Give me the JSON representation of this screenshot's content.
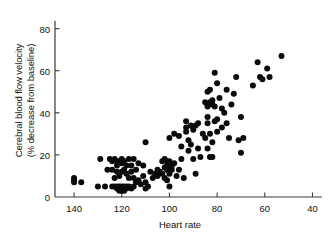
{
  "chart_data": {
    "type": "scatter",
    "title": "",
    "xlabel": "Heart rate",
    "ylabel": "Cerebral blood flow velocity (% decrease from baseline)",
    "ylabel_line1": "Cerebral blood flow velocity",
    "ylabel_line2": "(% decrease from baseline)",
    "xlim": [
      148,
      36
    ],
    "ylim": [
      0,
      86
    ],
    "x_reversed": true,
    "grid": false,
    "legend": null,
    "xticks": [
      140,
      120,
      100,
      80,
      60,
      40
    ],
    "xtick_labels": [
      "140",
      "120",
      "100",
      "80",
      "60",
      "40"
    ],
    "yticks": [
      0,
      20,
      40,
      60,
      80
    ],
    "ytick_labels": [
      "0",
      "20",
      "40",
      "60",
      "80"
    ],
    "marker": "filled-circle",
    "marker_color": "#0b0b0b",
    "marker_size_px": 3.0,
    "n_points": 147,
    "points": [
      [
        140,
        9
      ],
      [
        140,
        8
      ],
      [
        140,
        7
      ],
      [
        137,
        7
      ],
      [
        130,
        5
      ],
      [
        129,
        18
      ],
      [
        127,
        5
      ],
      [
        126,
        13
      ],
      [
        125,
        18
      ],
      [
        124,
        5
      ],
      [
        124,
        13
      ],
      [
        124,
        17
      ],
      [
        123,
        18
      ],
      [
        123,
        9
      ],
      [
        123,
        5
      ],
      [
        122,
        17
      ],
      [
        122,
        15
      ],
      [
        122,
        12
      ],
      [
        122,
        5
      ],
      [
        122,
        4
      ],
      [
        121,
        17
      ],
      [
        121,
        16
      ],
      [
        121,
        10
      ],
      [
        121,
        5
      ],
      [
        121,
        4
      ],
      [
        121,
        3
      ],
      [
        120,
        18
      ],
      [
        120,
        16
      ],
      [
        120,
        12
      ],
      [
        120,
        5
      ],
      [
        120,
        4
      ],
      [
        120,
        3
      ],
      [
        119,
        17
      ],
      [
        119,
        13
      ],
      [
        119,
        5
      ],
      [
        119,
        4
      ],
      [
        119,
        3
      ],
      [
        118,
        15
      ],
      [
        118,
        11
      ],
      [
        118,
        5
      ],
      [
        118,
        4
      ],
      [
        117,
        18
      ],
      [
        117,
        9
      ],
      [
        117,
        5
      ],
      [
        116,
        15
      ],
      [
        116,
        12
      ],
      [
        116,
        4
      ],
      [
        115,
        18
      ],
      [
        115,
        9
      ],
      [
        115,
        5
      ],
      [
        114,
        13
      ],
      [
        114,
        7
      ],
      [
        113,
        16
      ],
      [
        113,
        8
      ],
      [
        112,
        6
      ],
      [
        111,
        15
      ],
      [
        111,
        10
      ],
      [
        110,
        26
      ],
      [
        110,
        7
      ],
      [
        110,
        4
      ],
      [
        109,
        5
      ],
      [
        108,
        12
      ],
      [
        107,
        9
      ],
      [
        106,
        11
      ],
      [
        105,
        13
      ],
      [
        105,
        10
      ],
      [
        104,
        12
      ],
      [
        103,
        17
      ],
      [
        103,
        11
      ],
      [
        102,
        18
      ],
      [
        102,
        14
      ],
      [
        102,
        9
      ],
      [
        101,
        17
      ],
      [
        101,
        15
      ],
      [
        101,
        13
      ],
      [
        101,
        8
      ],
      [
        100,
        28
      ],
      [
        100,
        17
      ],
      [
        100,
        14
      ],
      [
        100,
        12
      ],
      [
        100,
        11
      ],
      [
        100,
        5
      ],
      [
        99,
        15
      ],
      [
        99,
        13
      ],
      [
        98,
        30
      ],
      [
        98,
        16
      ],
      [
        97,
        10
      ],
      [
        96,
        29
      ],
      [
        96,
        13
      ],
      [
        95,
        24
      ],
      [
        95,
        18
      ],
      [
        94,
        9
      ],
      [
        93,
        36
      ],
      [
        93,
        33
      ],
      [
        93,
        31
      ],
      [
        92,
        27
      ],
      [
        92,
        22
      ],
      [
        91,
        34
      ],
      [
        91,
        25
      ],
      [
        90,
        33
      ],
      [
        90,
        32
      ],
      [
        90,
        18
      ],
      [
        89,
        34
      ],
      [
        89,
        11
      ],
      [
        88,
        35
      ],
      [
        88,
        23
      ],
      [
        87,
        19
      ],
      [
        86,
        30
      ],
      [
        85,
        45
      ],
      [
        85,
        28
      ],
      [
        84,
        50
      ],
      [
        84,
        44
      ],
      [
        84,
        43
      ],
      [
        84,
        38
      ],
      [
        84,
        35
      ],
      [
        84,
        23
      ],
      [
        83,
        51
      ],
      [
        83,
        45
      ],
      [
        83,
        30
      ],
      [
        83,
        19
      ],
      [
        82,
        46
      ],
      [
        82,
        44
      ],
      [
        82,
        26
      ],
      [
        82,
        19
      ],
      [
        81,
        59
      ],
      [
        81,
        43
      ],
      [
        81,
        36
      ],
      [
        80,
        54
      ],
      [
        80,
        37
      ],
      [
        80,
        31
      ],
      [
        79,
        47
      ],
      [
        78,
        42
      ],
      [
        78,
        33
      ],
      [
        77,
        40
      ],
      [
        76,
        51
      ],
      [
        76,
        35
      ],
      [
        75,
        28
      ],
      [
        74,
        44
      ],
      [
        73,
        49
      ],
      [
        72,
        57
      ],
      [
        71,
        27
      ],
      [
        70,
        38
      ],
      [
        70,
        21
      ],
      [
        69,
        28
      ],
      [
        65,
        53
      ],
      [
        63,
        64
      ],
      [
        62,
        57
      ],
      [
        61,
        56
      ],
      [
        59,
        61
      ],
      [
        58,
        57
      ],
      [
        53,
        67
      ]
    ]
  }
}
